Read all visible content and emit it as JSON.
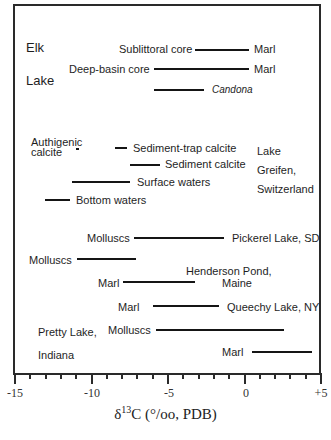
{
  "chart_data": {
    "type": "range-bar",
    "title": "",
    "xlabel_parts": {
      "delta": "δ",
      "sup": "13",
      "rest": "C (°/oo, PDB)"
    },
    "xlim": [
      -15,
      5
    ],
    "major_ticks": [
      -15,
      -10,
      -5,
      0,
      5
    ],
    "tick_labels": [
      "-15",
      "-10",
      "-5",
      "0",
      "+5"
    ],
    "minor_tick_step": 1,
    "groups": [
      {
        "site": "Elk Lake",
        "site_label_lines": [
          "Elk",
          "Lake"
        ],
        "series": [
          {
            "name": "Sublittoral core — Marl",
            "left_label": "Sublittoral core",
            "right_label": "Marl",
            "x_min": -3.3,
            "x_max": 0.2
          },
          {
            "name": "Deep-basin core — Marl",
            "left_label": "Deep-basin core",
            "right_label": "Marl",
            "x_min": -6.0,
            "x_max": 0.2
          },
          {
            "name": "Candona",
            "left_label": "",
            "right_label": "Candona",
            "x_min": -6.0,
            "x_max": -2.7
          }
        ]
      },
      {
        "site": "Lake Greifen, Switzerland",
        "site_label_lines": [
          "Lake",
          "Greifen,",
          "Switzerland"
        ],
        "series": [
          {
            "name": "Authigenic calcite",
            "left_label": "Authigenic calcite",
            "right_label": "",
            "x_min": -11.0,
            "x_max": -11.0
          },
          {
            "name": "Sediment-trap calcite",
            "left_label": "",
            "right_label": "Sediment-trap calcite",
            "x_min": -8.5,
            "x_max": -7.7
          },
          {
            "name": "Sediment calcite",
            "left_label": "",
            "right_label": "Sediment calcite",
            "x_min": -7.5,
            "x_max": -5.6
          },
          {
            "name": "Surface waters",
            "left_label": "",
            "right_label": "Surface waters",
            "x_min": -11.3,
            "x_max": -7.5
          },
          {
            "name": "Bottom waters",
            "left_label": "",
            "right_label": "Bottom waters",
            "x_min": -13.1,
            "x_max": -11.5
          }
        ]
      },
      {
        "site": "Pickerel Lake, SD",
        "series": [
          {
            "name": "Molluscs",
            "left_label": "Molluscs",
            "right_label": "Pickerel Lake, SD",
            "x_min": -7.3,
            "x_max": -1.4
          }
        ]
      },
      {
        "site": "Henderson Pond, Maine",
        "series": [
          {
            "name": "Molluscs",
            "left_label": "Molluscs",
            "right_label": "",
            "x_min": -11.0,
            "x_max": -7.2
          },
          {
            "name": "Marl",
            "left_label": "Marl",
            "right_label": "Henderson Pond, Maine",
            "x_min": -8.0,
            "x_max": -3.3
          }
        ]
      },
      {
        "site": "Queechy Lake, NY",
        "series": [
          {
            "name": "Marl",
            "left_label": "Marl",
            "right_label": "Queechy Lake, NY",
            "x_min": -6.1,
            "x_max": -1.8
          }
        ]
      },
      {
        "site": "Pretty Lake, Indiana",
        "site_label_lines": [
          "Pretty Lake,",
          "Indiana"
        ],
        "series": [
          {
            "name": "Molluscs",
            "left_label": "Molluscs",
            "right_label": "",
            "x_min": -5.9,
            "x_max": 2.5
          },
          {
            "name": "Marl",
            "left_label": "Marl",
            "right_label": "",
            "x_min": 0.4,
            "x_max": 4.3
          }
        ]
      }
    ]
  },
  "labels": {
    "elk": "Elk",
    "lake": "Lake",
    "sublittoral": "Sublittoral core",
    "marl": "Marl",
    "deep_basin": "Deep-basin core",
    "candona": "Candona",
    "authigenic": "Authigenic",
    "calcite": "calcite",
    "sediment_trap": "Sediment-trap calcite",
    "sediment_calcite": "Sediment calcite",
    "surface_waters": "Surface waters",
    "bottom_waters": "Bottom waters",
    "greifen_1": "Lake",
    "greifen_2": "Greifen,",
    "greifen_3": "Switzerland",
    "molluscs": "Molluscs",
    "pickerel": "Pickerel Lake, SD",
    "henderson_1": "Henderson Pond,",
    "henderson_2": "Maine",
    "queechy": "Queechy Lake, NY",
    "pretty_1": "Pretty Lake,",
    "pretty_2": "Indiana"
  },
  "axis": {
    "tick_m15": "-15",
    "tick_m10": "-10",
    "tick_m5": "-5",
    "tick_0": "0",
    "tick_p5": "+5",
    "xlabel_delta": "δ",
    "xlabel_sup": "13",
    "xlabel_rest": "C (°/oo, PDB)"
  }
}
